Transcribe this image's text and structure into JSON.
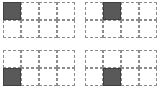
{
  "figure": {
    "background_color": "#ffffff",
    "grid_line_color": "#8c8c8c",
    "filled_cell_color": "#595959",
    "filled_cell_border_color": "#404040",
    "panel_columns": 4,
    "panel_rows": 2,
    "cell_size_px": 18
  },
  "panels": [
    {
      "name": "top-left",
      "label": "",
      "columns": 4,
      "rows": 2,
      "filled_cell": {
        "row": 1,
        "col": 1
      },
      "cells": [
        {
          "row": 1,
          "col": 1,
          "state": "filled"
        },
        {
          "row": 1,
          "col": 2,
          "state": "empty"
        },
        {
          "row": 1,
          "col": 3,
          "state": "empty"
        },
        {
          "row": 1,
          "col": 4,
          "state": "empty"
        },
        {
          "row": 2,
          "col": 1,
          "state": "empty"
        },
        {
          "row": 2,
          "col": 2,
          "state": "empty"
        },
        {
          "row": 2,
          "col": 3,
          "state": "empty"
        },
        {
          "row": 2,
          "col": 4,
          "state": "empty"
        }
      ]
    },
    {
      "name": "top-right",
      "label": "",
      "columns": 4,
      "rows": 2,
      "filled_cell": {
        "row": 1,
        "col": 2
      },
      "cells": [
        {
          "row": 1,
          "col": 1,
          "state": "empty"
        },
        {
          "row": 1,
          "col": 2,
          "state": "filled"
        },
        {
          "row": 1,
          "col": 3,
          "state": "empty"
        },
        {
          "row": 1,
          "col": 4,
          "state": "empty"
        },
        {
          "row": 2,
          "col": 1,
          "state": "empty"
        },
        {
          "row": 2,
          "col": 2,
          "state": "empty"
        },
        {
          "row": 2,
          "col": 3,
          "state": "empty"
        },
        {
          "row": 2,
          "col": 4,
          "state": "empty"
        }
      ]
    },
    {
      "name": "bottom-left",
      "label": "",
      "columns": 4,
      "rows": 2,
      "filled_cell": {
        "row": 2,
        "col": 1
      },
      "cells": [
        {
          "row": 1,
          "col": 1,
          "state": "empty"
        },
        {
          "row": 1,
          "col": 2,
          "state": "empty"
        },
        {
          "row": 1,
          "col": 3,
          "state": "empty"
        },
        {
          "row": 1,
          "col": 4,
          "state": "empty"
        },
        {
          "row": 2,
          "col": 1,
          "state": "filled"
        },
        {
          "row": 2,
          "col": 2,
          "state": "empty"
        },
        {
          "row": 2,
          "col": 3,
          "state": "empty"
        },
        {
          "row": 2,
          "col": 4,
          "state": "empty"
        }
      ]
    },
    {
      "name": "bottom-right",
      "label": "",
      "columns": 4,
      "rows": 2,
      "filled_cell": {
        "row": 2,
        "col": 2
      },
      "cells": [
        {
          "row": 1,
          "col": 1,
          "state": "empty"
        },
        {
          "row": 1,
          "col": 2,
          "state": "empty"
        },
        {
          "row": 1,
          "col": 3,
          "state": "empty"
        },
        {
          "row": 1,
          "col": 4,
          "state": "empty"
        },
        {
          "row": 2,
          "col": 1,
          "state": "empty"
        },
        {
          "row": 2,
          "col": 2,
          "state": "filled"
        },
        {
          "row": 2,
          "col": 3,
          "state": "empty"
        },
        {
          "row": 2,
          "col": 4,
          "state": "empty"
        }
      ]
    }
  ]
}
